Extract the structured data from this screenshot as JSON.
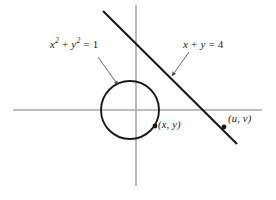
{
  "figure": {
    "colors": {
      "background": "#ffffff",
      "axis": "#a9a9a9",
      "curve": "#1a1a1a",
      "leader": "#555555",
      "text": "#1a1a1a"
    },
    "labels": {
      "circle_equation": "x² + y² = 1",
      "circle_equation_parts": {
        "var1": "x",
        "exp1": "2",
        "plus": " + ",
        "var2": "y",
        "exp2": "2",
        "equals": " = ",
        "value": "1"
      },
      "line_equation": "x + y = 4",
      "line_equation_parts": {
        "var1": "x",
        "plus": " + ",
        "var2": "y",
        "equals": " = ",
        "value": "4"
      },
      "point_on_circle": "(x, y)",
      "point_on_line": "(u, v)"
    },
    "geometry": {
      "x_axis": {
        "x1": 13,
        "y1": 110,
        "x2": 262,
        "y2": 110
      },
      "y_axis": {
        "x1": 136,
        "y1": 5,
        "x2": 136,
        "y2": 186
      },
      "circle": {
        "cx": 130,
        "cy": 110,
        "r": 29
      },
      "line": {
        "x1": 103,
        "y1": 11,
        "x2": 237,
        "y2": 144
      },
      "point_xy": {
        "cx": 155,
        "cy": 126
      },
      "point_uv": {
        "cx": 224,
        "cy": 127
      },
      "leader_circle": {
        "x1": 98,
        "y1": 57,
        "x2": 119,
        "y2": 86
      },
      "leader_line": {
        "x1": 189,
        "y1": 52,
        "x2": 171,
        "y2": 77
      }
    }
  }
}
